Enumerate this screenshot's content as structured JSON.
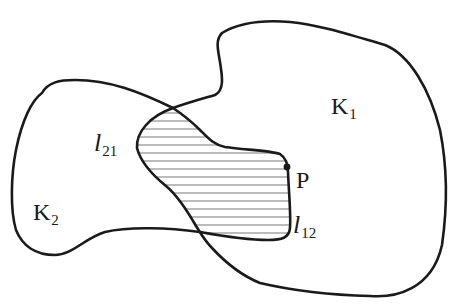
{
  "diagram": {
    "type": "set-intersection-figure",
    "regions": [
      {
        "id": "K1",
        "label": "K",
        "subscript": "1"
      },
      {
        "id": "K2",
        "label": "K",
        "subscript": "2"
      }
    ],
    "intersection": {
      "fill": "horizontal-hatching"
    },
    "boundary_labels": [
      {
        "id": "l21",
        "label": "l",
        "subscript": "21"
      },
      {
        "id": "l12",
        "label": "l",
        "subscript": "12"
      }
    ],
    "point": {
      "label": "P"
    },
    "colors": {
      "stroke": "#1a1a1a",
      "hatch": "#7a7a7a",
      "background": "#ffffff"
    }
  }
}
